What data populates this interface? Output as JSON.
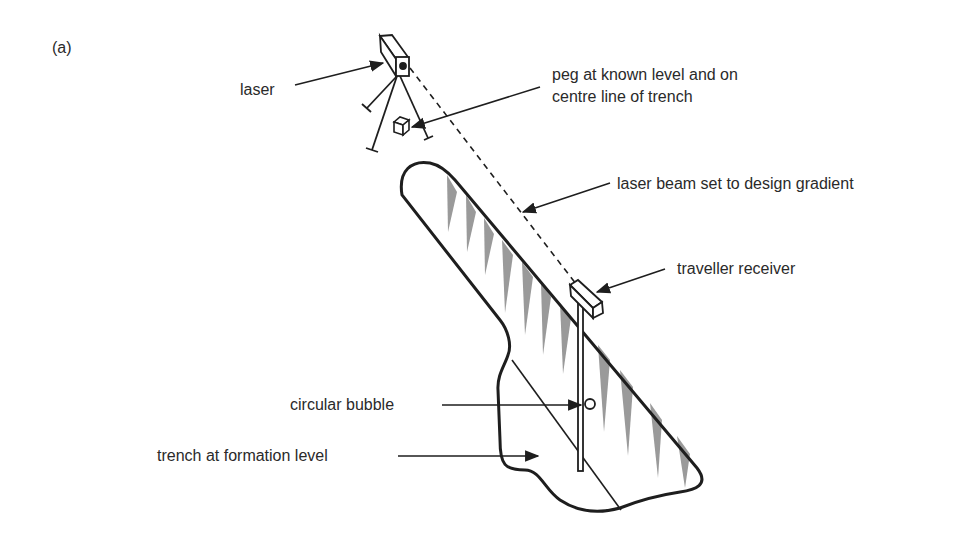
{
  "figure": {
    "panel_label": "(a)",
    "labels": {
      "laser": "laser",
      "peg_line1": "peg at known level and on",
      "peg_line2": "centre line of trench",
      "beam": "laser beam set to design gradient",
      "receiver": "traveller receiver",
      "bubble": "circular bubble",
      "trench": "trench at formation level"
    },
    "colors": {
      "stroke": "#1e1e1e",
      "hatch": "#9a9a9a",
      "background": "#ffffff"
    }
  }
}
